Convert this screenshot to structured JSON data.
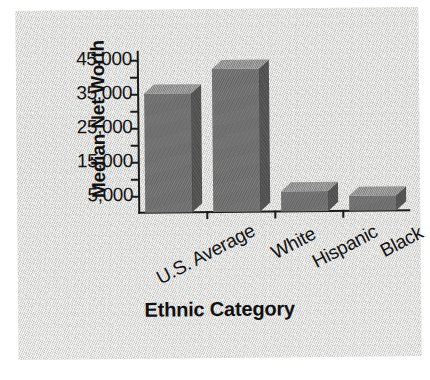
{
  "chart_data": {
    "type": "bar",
    "title": "",
    "xlabel": "Ethnic Category",
    "ylabel": "Median Net Worth",
    "categories": [
      "U.S. Average",
      "White",
      "Hispanic",
      "Black"
    ],
    "values": [
      35000,
      42000,
      6000,
      4500
    ],
    "series": [
      {
        "name": "Median Net Worth",
        "values": [
          35000,
          42000,
          6000,
          4500
        ]
      }
    ],
    "ytick_labels": [
      "45,000",
      "35,000",
      "25,000",
      "15,000",
      "5,000"
    ],
    "ytick_values": [
      45000,
      35000,
      25000,
      15000,
      5000
    ],
    "yminor_step": 5000,
    "ylim": [
      0,
      47500
    ],
    "xlim_note": "categorical",
    "grid": false,
    "legend": "none",
    "style": "3d-bar",
    "bar_face_color": "#6e6e6e",
    "bar_top_color": "#8e8e8e",
    "bar_side_color": "#545454",
    "axis_color": "#1b1b1b",
    "background_color": "#d8d8d6",
    "text_color": "#131313"
  },
  "axis": {
    "y_title": "Median Net Worth",
    "x_title": "Ethnic Category"
  }
}
